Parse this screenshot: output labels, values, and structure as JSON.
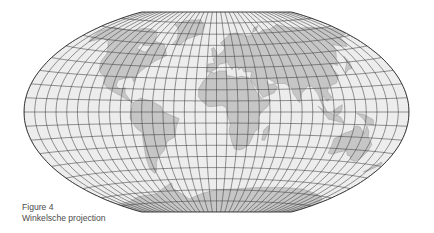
{
  "figure": {
    "label": "Figure 4",
    "title": "Winkelsche projection"
  },
  "map": {
    "projection": "Winkel",
    "colors": {
      "ocean": "#ededed",
      "land": "#c6c6c6",
      "graticule": "#3c3c3c",
      "outline": "#2e2e2e",
      "background": "#ffffff"
    },
    "graticule_step_deg": 10,
    "features": [
      "North America",
      "South America",
      "Greenland",
      "Europe",
      "Africa",
      "Asia",
      "Australia",
      "Antarctica"
    ]
  }
}
